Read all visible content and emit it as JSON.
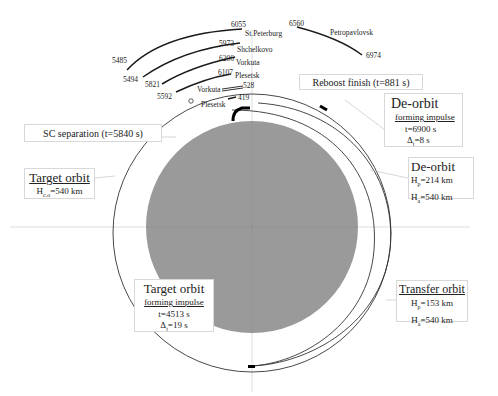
{
  "diagram": {
    "type": "orbital-maneuver-scheme",
    "colors": {
      "earth_fill": "#9a9a9a",
      "orbit_line": "#333333",
      "track_line": "#1a1a1a",
      "box_border": "#d8d8d8"
    },
    "ground_tracks": [
      {
        "start": "5485",
        "end": "6055",
        "station": "St.Peterburg"
      },
      {
        "start": "5494",
        "end": "5973",
        "station": "Shchelkovo"
      },
      {
        "start": "5821",
        "end": "6206",
        "station": "Vorkuta"
      },
      {
        "start": "5592",
        "end": "6107",
        "station": "Plesetsk"
      },
      {
        "start": "",
        "end": "528",
        "station": "Vorkuta"
      },
      {
        "start": "",
        "end": "419",
        "station": "Plesetsk"
      },
      {
        "start": "6560",
        "end": "6974",
        "station": "Petropavlovsk"
      }
    ],
    "callouts": {
      "reboost_finish": "Reboost finish (t=881 s)",
      "sc_separation": "SC separation (t=5840 s)",
      "target_orbit": {
        "title": "Target orbit",
        "line1_label": "H",
        "line1_sub": "c.o",
        "line1_value": "=540 km"
      },
      "deorbit_impulse": {
        "title": "De-orbit",
        "subtitle": "forming impulse",
        "time": "t=6900 s",
        "dt_label": "Δ",
        "dt_sub": "t",
        "dt_value": "=8 s"
      },
      "deorbit": {
        "title": "De-orbit",
        "hp_label": "H",
        "hp_sub": "p",
        "hp_value": "=214 km",
        "ha_label": "H",
        "ha_sub": "a",
        "ha_value": "=540 km"
      },
      "target_orbit_impulse": {
        "title": "Target orbit",
        "subtitle": "forming impulse",
        "time": "t=4513 s",
        "dt_label": "Δ",
        "dt_sub": "t",
        "dt_value": "=19 s"
      },
      "transfer_orbit": {
        "title": "Transfer orbit",
        "hp_label": "H",
        "hp_sub": "p",
        "hp_value": "=153 km",
        "ha_label": "H",
        "ha_sub": "a",
        "ha_value": "=540 km"
      }
    }
  }
}
